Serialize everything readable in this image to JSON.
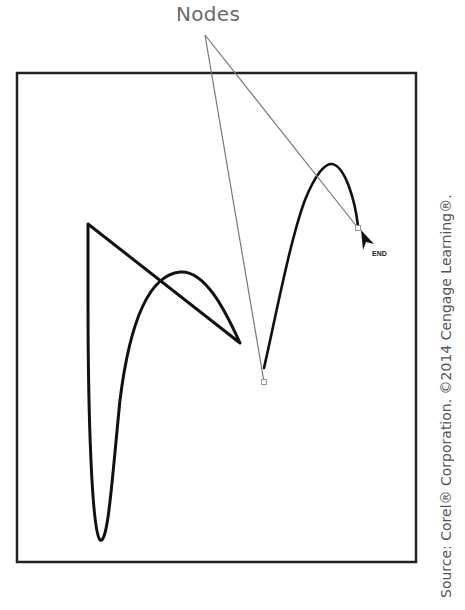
{
  "diagram": {
    "callout_label": "Nodes",
    "end_label": "END",
    "source_credit": "Source: Corel® Corporation. ©2014 Cengage Learning®.",
    "colors": {
      "frame": "#222222",
      "stroke": "#111111",
      "callout_line": "#777777",
      "callout_text": "#6a6a6a",
      "node_marker": "#999999"
    },
    "elements": [
      {
        "type": "frame",
        "description": "Rectangular drawing page border"
      },
      {
        "type": "path",
        "description": "Freehand/Bezier stroke with straight diagonal, vertical drop, loop and curve"
      },
      {
        "type": "path",
        "description": "Curved stroke rising to a peak and ending at END arrow"
      },
      {
        "type": "node",
        "description": "Node at bottom cusp of second curve"
      },
      {
        "type": "node",
        "description": "Node at end of second curve"
      },
      {
        "type": "arrow",
        "description": "End arrowhead cursor"
      }
    ]
  }
}
